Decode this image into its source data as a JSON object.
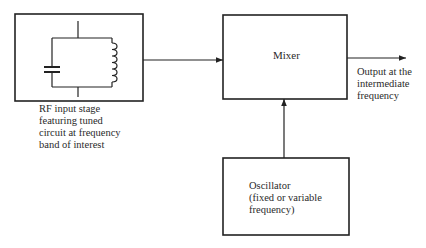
{
  "diagram": {
    "type": "block-diagram",
    "blocks": [
      {
        "id": "rf-input-stage",
        "label_lines": [
          "RF input stage",
          "featuring tuned",
          "circuit at frequency",
          "band of interest"
        ],
        "contains": "parallel LC tuned circuit (capacitor and inductor)"
      },
      {
        "id": "mixer",
        "label_lines": [
          "Mixer"
        ]
      },
      {
        "id": "oscillator",
        "label_lines": [
          "Oscillator",
          "(fixed or variable",
          "frequency)"
        ]
      }
    ],
    "edges": [
      {
        "from": "rf-input-stage",
        "to": "mixer"
      },
      {
        "from": "oscillator",
        "to": "mixer"
      },
      {
        "from": "mixer",
        "to": "output"
      }
    ],
    "output": {
      "label_lines": [
        "Output at the",
        "intermediate",
        "frequency"
      ]
    }
  },
  "colors": {
    "line": "#222222",
    "background": "#ffffff"
  }
}
